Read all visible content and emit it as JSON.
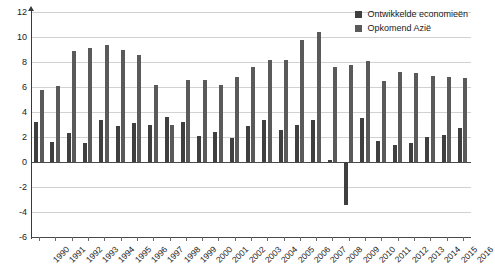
{
  "chart_data": {
    "type": "bar",
    "title": "",
    "subtitle": "",
    "xlabel": "",
    "ylabel": "",
    "ylim": [
      -6,
      12
    ],
    "ytick_step": 2,
    "yticks": [
      12,
      10,
      8,
      6,
      4,
      2,
      0,
      -2,
      -4,
      -6
    ],
    "grid": true,
    "legend_position": "top-right",
    "categories": [
      "1990",
      "1991",
      "1992",
      "1993",
      "1994",
      "1995",
      "1996",
      "1997",
      "1998",
      "1999",
      "2000",
      "2001",
      "2002",
      "2003",
      "2004",
      "2005",
      "2006",
      "2007",
      "2008",
      "2009",
      "2010",
      "2011",
      "2012",
      "2013",
      "2014",
      "2015",
      "2016"
    ],
    "series": [
      {
        "name": "Ontwikkelde economieën",
        "color": "#3f3f3f",
        "values": [
          3.2,
          1.6,
          2.3,
          1.5,
          3.4,
          2.9,
          3.1,
          3.0,
          3.6,
          3.2,
          2.1,
          2.4,
          1.9,
          2.9,
          3.4,
          2.6,
          3.0,
          3.4,
          0.2,
          -3.4,
          3.5,
          1.7,
          1.4,
          1.5,
          2.0,
          2.2,
          2.7
        ]
      },
      {
        "name": "Opkomend Azië",
        "color": "#5a5a5a",
        "values": [
          5.8,
          6.1,
          8.9,
          9.1,
          9.4,
          9.0,
          8.6,
          6.2,
          3.0,
          6.6,
          6.6,
          6.2,
          6.8,
          7.6,
          8.2,
          8.2,
          9.8,
          10.4,
          7.6,
          7.8,
          8.1,
          6.5,
          7.2,
          7.1,
          6.9,
          6.8,
          6.7
        ]
      }
    ]
  },
  "legend": {
    "items": [
      {
        "label": "Ontwikkelde economieën"
      },
      {
        "label": "Opkomend Azië"
      }
    ]
  }
}
